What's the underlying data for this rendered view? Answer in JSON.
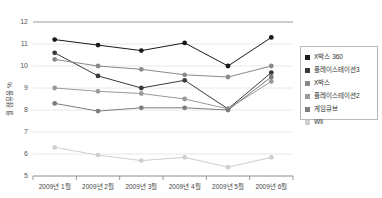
{
  "chart_data": {
    "type": "line",
    "title": "",
    "xlabel": "",
    "ylabel": "월 점유율 %",
    "ylim": [
      5,
      12
    ],
    "yticks": [
      5,
      6,
      7,
      8,
      9,
      10,
      11,
      12
    ],
    "grid": true,
    "legend_position": "right",
    "categories": [
      "2009년 1월",
      "2009년 2월",
      "2009년 3월",
      "2009년 4월",
      "2009년 5월",
      "2009년 6월"
    ],
    "series": [
      {
        "name": "X박스 360",
        "color": "#1a1a1a",
        "values": [
          11.2,
          10.95,
          10.7,
          11.05,
          10.0,
          11.3
        ]
      },
      {
        "name": "플레이스테이션3",
        "color": "#3a3a3a",
        "values": [
          10.6,
          9.55,
          9.0,
          9.35,
          8.05,
          9.7
        ]
      },
      {
        "name": "X박스",
        "color": "#8a8a8a",
        "values": [
          10.3,
          10.0,
          9.85,
          9.6,
          9.5,
          10.0
        ]
      },
      {
        "name": "플레이스테이션2",
        "color": "#9a9a9a",
        "values": [
          9.0,
          8.85,
          8.75,
          8.5,
          8.05,
          9.3
        ]
      },
      {
        "name": "게임큐브",
        "color": "#7d7d7d",
        "values": [
          8.3,
          7.95,
          8.1,
          8.1,
          8.0,
          9.5
        ]
      },
      {
        "name": "Wii",
        "color": "#cfcfcf",
        "values": [
          6.3,
          5.95,
          5.7,
          5.85,
          5.4,
          5.85
        ]
      }
    ]
  },
  "legend": {
    "items": [
      {
        "label": "X박스 360",
        "color": "#1a1a1a"
      },
      {
        "label": "플레이스테이션3",
        "color": "#3a3a3a"
      },
      {
        "label": "X박스",
        "color": "#8a8a8a"
      },
      {
        "label": "플레이스테이션2",
        "color": "#9a9a9a"
      },
      {
        "label": "게임큐브",
        "color": "#7d7d7d"
      },
      {
        "label": "Wii",
        "color": "#cfcfcf"
      }
    ]
  }
}
